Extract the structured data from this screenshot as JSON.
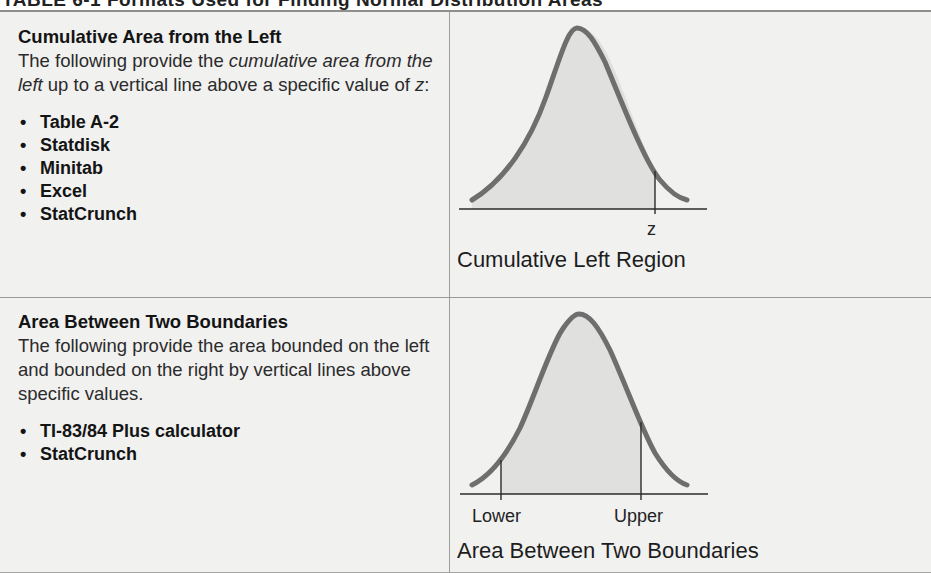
{
  "table": {
    "title_partial": "TABLE 6-1 Formats Used for Finding Normal Distribution Areas",
    "rows": [
      {
        "title": "Cumulative Area from the Left",
        "desc_pre": "The following provide the ",
        "desc_em1": "cumulative area from the left",
        "desc_post": " up to a vertical line above a specific value of ",
        "desc_var": "z",
        "desc_end": ":",
        "tools": [
          "Table A-2",
          "Statdisk",
          "Minitab",
          "Excel",
          "StatCrunch"
        ],
        "figure": {
          "marker_labels": [
            "z"
          ],
          "caption": "Cumulative Left Region"
        }
      },
      {
        "title": "Area Between Two Boundaries",
        "desc": "The following provide the area bounded on the left and bounded on the right by vertical lines above specific values.",
        "tools": [
          "TI-83/84 Plus calculator",
          "StatCrunch"
        ],
        "figure": {
          "marker_labels": [
            "Lower",
            "Upper"
          ],
          "caption": "Area Between Two Boundaries"
        }
      }
    ]
  },
  "icons": {
    "bullet": "•"
  },
  "colors": {
    "background": "#f1f1f0",
    "curve": "#6b6b6b",
    "shade": "#e2e2e2",
    "rule": "#8f8f8f"
  }
}
